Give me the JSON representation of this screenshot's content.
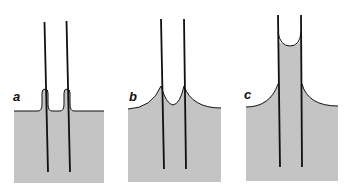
{
  "figure": {
    "panels": [
      {
        "id": "a",
        "label": "a"
      },
      {
        "id": "b",
        "label": "b"
      },
      {
        "id": "c",
        "label": "c"
      }
    ],
    "colors": {
      "liquid": "#c4c4c4",
      "line": "#111111",
      "background": "#ffffff"
    }
  }
}
